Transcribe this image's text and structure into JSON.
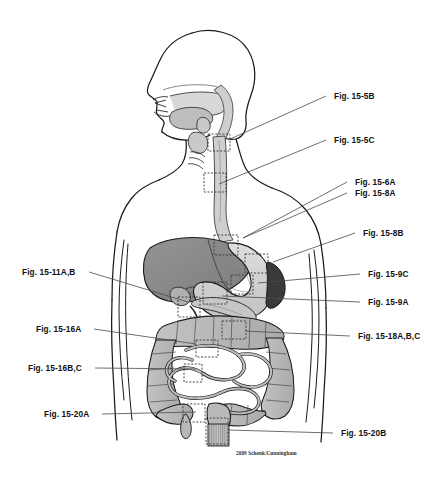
{
  "figure": {
    "credit": "2009 Schenk/Cunningham",
    "background_color": "#ffffff",
    "palette": {
      "outline": "#1a1a1a",
      "liver": "#8a8a8a",
      "stomach": "#d0d0d0",
      "spleen": "#3a3a3a",
      "intestine": "#b5b5b5",
      "esophagus": "#cfcfcf",
      "leader_line": "#4a4a4a",
      "callout_box": "#333333",
      "label_text": "#111111"
    }
  },
  "callouts": {
    "right": [
      {
        "id": "fig-15-5B",
        "label": "Fig. 15-5B",
        "x": 334,
        "y": 91,
        "anchor_x": 228,
        "anchor_y": 140,
        "target": "pharynx-larynx"
      },
      {
        "id": "fig-15-5C",
        "label": "Fig. 15-5C",
        "x": 334,
        "y": 135,
        "anchor_x": 219,
        "anchor_y": 184,
        "target": "upper-esophagus"
      },
      {
        "id": "fig-15-6A",
        "label": "Fig. 15-6A",
        "x": 355,
        "y": 177,
        "anchor_x": 243,
        "anchor_y": 238,
        "target": "lower-esophagus"
      },
      {
        "id": "fig-15-8A",
        "label": "Fig. 15-8A",
        "x": 355,
        "y": 188,
        "anchor_x": 243,
        "anchor_y": 238,
        "target": "gastroesophageal-junction"
      },
      {
        "id": "fig-15-8B",
        "label": "Fig. 15-8B",
        "x": 363,
        "y": 228,
        "anchor_x": 273,
        "anchor_y": 262,
        "target": "stomach-fundus"
      },
      {
        "id": "fig-15-9C",
        "label": "Fig. 15-9C",
        "x": 368,
        "y": 269,
        "anchor_x": 258,
        "anchor_y": 283,
        "target": "stomach-body"
      },
      {
        "id": "fig-15-9A",
        "label": "Fig. 15-9A",
        "x": 368,
        "y": 297,
        "anchor_x": 222,
        "anchor_y": 296,
        "target": "stomach-antrum"
      },
      {
        "id": "fig-15-18A-B-C",
        "label": "Fig. 15-18A,B,C",
        "x": 358,
        "y": 331,
        "anchor_x": 245,
        "anchor_y": 331,
        "target": "transverse-colon"
      },
      {
        "id": "fig-15-20B",
        "label": "Fig. 15-20B",
        "x": 341,
        "y": 428,
        "anchor_x": 228,
        "anchor_y": 430,
        "target": "anal-canal"
      }
    ],
    "left": [
      {
        "id": "fig-15-11A-B",
        "label": "Fig. 15-11A,B",
        "x": 22,
        "y": 267,
        "anchor_x": 188,
        "anchor_y": 302,
        "target": "duodenum-pancreas"
      },
      {
        "id": "fig-15-16A",
        "label": "Fig. 15-16A",
        "x": 36,
        "y": 324,
        "anchor_x": 196,
        "anchor_y": 344,
        "target": "jejunum"
      },
      {
        "id": "fig-15-16B-C",
        "label": "Fig. 15-16B,C",
        "x": 28,
        "y": 363,
        "anchor_x": 196,
        "anchor_y": 369,
        "target": "ileum"
      },
      {
        "id": "fig-15-20A",
        "label": "Fig. 15-20A",
        "x": 44,
        "y": 409,
        "anchor_x": 196,
        "anchor_y": 412,
        "target": "appendix"
      }
    ]
  },
  "callout_boxes": [
    {
      "id": "box-pharynx",
      "x": 208,
      "y": 134,
      "w": 22,
      "h": 17
    },
    {
      "id": "box-upper-eso",
      "x": 204,
      "y": 173,
      "w": 22,
      "h": 19
    },
    {
      "id": "box-ge-junction",
      "x": 214,
      "y": 235,
      "w": 24,
      "h": 20
    },
    {
      "id": "box-fundus",
      "x": 245,
      "y": 254,
      "w": 23,
      "h": 19
    },
    {
      "id": "box-stomach-body",
      "x": 231,
      "y": 275,
      "w": 22,
      "h": 19
    },
    {
      "id": "box-antrum",
      "x": 203,
      "y": 282,
      "w": 24,
      "h": 22
    },
    {
      "id": "box-duodenum",
      "x": 178,
      "y": 297,
      "w": 22,
      "h": 20
    },
    {
      "id": "box-colon",
      "x": 222,
      "y": 321,
      "w": 24,
      "h": 18
    },
    {
      "id": "box-jejunum",
      "x": 196,
      "y": 340,
      "w": 22,
      "h": 17
    },
    {
      "id": "box-ileum",
      "x": 184,
      "y": 364,
      "w": 18,
      "h": 18
    },
    {
      "id": "box-appendix",
      "x": 183,
      "y": 404,
      "w": 22,
      "h": 18
    },
    {
      "id": "box-anal-canal",
      "x": 206,
      "y": 418,
      "w": 22,
      "h": 26
    }
  ],
  "organs": [
    {
      "id": "head-profile",
      "name": "head in lateral profile"
    },
    {
      "id": "nasal-cavity",
      "name": "nasal cavity"
    },
    {
      "id": "oral-cavity",
      "name": "oral cavity and tongue"
    },
    {
      "id": "pharynx",
      "name": "pharynx"
    },
    {
      "id": "larynx",
      "name": "larynx"
    },
    {
      "id": "esophagus",
      "name": "esophagus"
    },
    {
      "id": "liver",
      "name": "liver"
    },
    {
      "id": "gallbladder",
      "name": "gallbladder"
    },
    {
      "id": "stomach",
      "name": "stomach"
    },
    {
      "id": "spleen",
      "name": "spleen"
    },
    {
      "id": "pancreas",
      "name": "pancreas"
    },
    {
      "id": "duodenum",
      "name": "duodenum"
    },
    {
      "id": "small-intestine",
      "name": "small intestine"
    },
    {
      "id": "ascending-colon",
      "name": "ascending colon"
    },
    {
      "id": "transverse-colon",
      "name": "transverse colon"
    },
    {
      "id": "descending-colon",
      "name": "descending colon"
    },
    {
      "id": "sigmoid-colon",
      "name": "sigmoid colon"
    },
    {
      "id": "cecum",
      "name": "cecum"
    },
    {
      "id": "appendix",
      "name": "vermiform appendix"
    },
    {
      "id": "rectum",
      "name": "rectum"
    },
    {
      "id": "anal-canal",
      "name": "anal canal"
    },
    {
      "id": "torso-outline",
      "name": "torso and arms outline"
    }
  ]
}
